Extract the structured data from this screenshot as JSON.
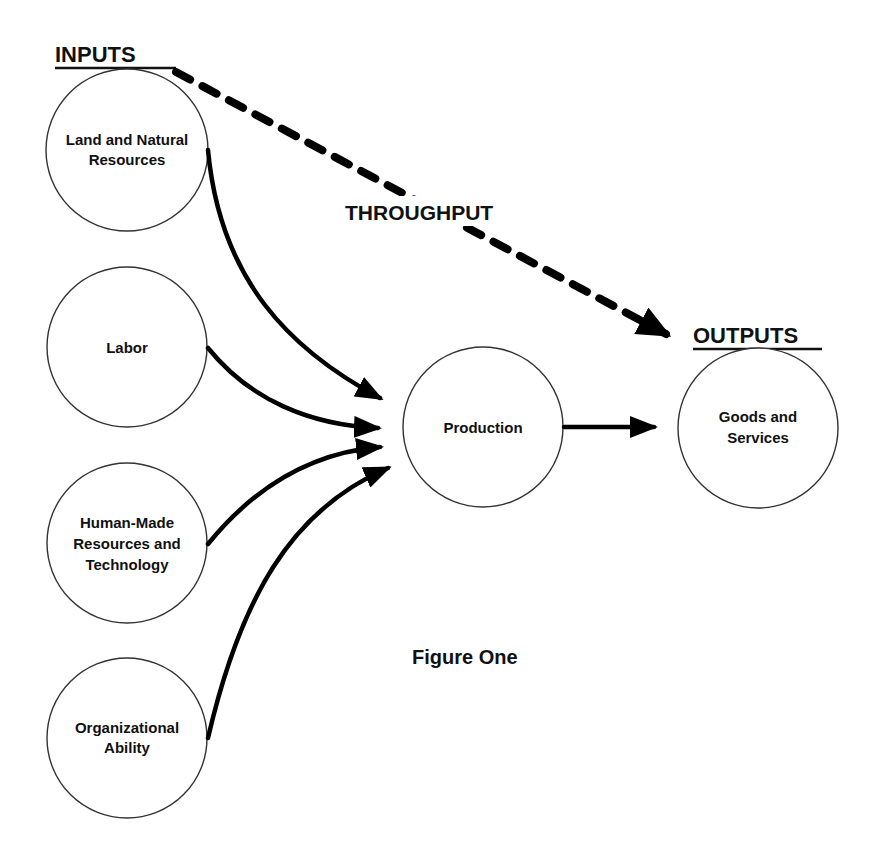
{
  "headings": {
    "inputs": "INPUTS",
    "outputs": "OUTPUTS",
    "throughput": "THROUGHPUT"
  },
  "caption": "Figure One",
  "nodes": {
    "inputs": [
      {
        "id": "land",
        "lines": [
          "Land and Natural",
          "Resources"
        ]
      },
      {
        "id": "labor",
        "lines": [
          "Labor"
        ]
      },
      {
        "id": "human_made",
        "lines": [
          "Human-Made",
          "Resources and",
          "Technology"
        ]
      },
      {
        "id": "organizational",
        "lines": [
          "Organizational",
          "Ability"
        ]
      }
    ],
    "process": {
      "id": "production",
      "lines": [
        "Production"
      ]
    },
    "output": {
      "id": "goods",
      "lines": [
        "Goods and",
        "Services"
      ]
    }
  },
  "edges": [
    {
      "from": "land",
      "to": "production",
      "style": "solid"
    },
    {
      "from": "labor",
      "to": "production",
      "style": "solid"
    },
    {
      "from": "human_made",
      "to": "production",
      "style": "solid"
    },
    {
      "from": "organizational",
      "to": "production",
      "style": "solid"
    },
    {
      "from": "production",
      "to": "goods",
      "style": "solid"
    },
    {
      "from": "inputs",
      "to": "outputs",
      "style": "dashed",
      "label": "THROUGHPUT"
    }
  ],
  "colors": {
    "stroke": "#000000",
    "circle_outline": "#333333",
    "text": "#111111",
    "background": "#ffffff"
  }
}
